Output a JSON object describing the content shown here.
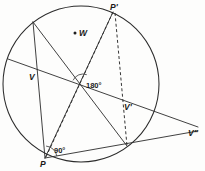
{
  "figure": {
    "background_color": "#fdfdfc",
    "ink_color": "#2b2b2b",
    "width": 205,
    "height": 171
  },
  "circle": {
    "name": "main-circle",
    "center_x": 81,
    "center_y": 84,
    "radius": 78
  },
  "points": [
    {
      "id": "P",
      "label": "P",
      "x": 45,
      "y": 158,
      "label_x": 40,
      "label_y": 167,
      "dot": false
    },
    {
      "id": "Pp",
      "label": "P'",
      "x": 113,
      "y": 12,
      "label_x": 110,
      "label_y": 10,
      "dot": false
    },
    {
      "id": "V",
      "label": "V",
      "x": 32,
      "y": 73,
      "label_x": 29,
      "label_y": 80,
      "dot": false
    },
    {
      "id": "Vp",
      "label": "V'",
      "x": 125,
      "y": 103,
      "label_x": 124,
      "label_y": 110,
      "dot": false
    },
    {
      "id": "Vpp",
      "label": "V\"",
      "x": 188,
      "y": 128,
      "label_x": 188,
      "label_y": 136,
      "dot": false
    },
    {
      "id": "W",
      "label": "W",
      "x": 75,
      "y": 33,
      "label_x": 79,
      "label_y": 36,
      "dot": true
    },
    {
      "id": "T",
      "label": "",
      "x": 33,
      "y": 22,
      "label_x": 0,
      "label_y": 0,
      "dot": false
    },
    {
      "id": "B",
      "label": "",
      "x": 127,
      "y": 146,
      "label_x": 0,
      "label_y": 0,
      "dot": false
    },
    {
      "id": "O",
      "label": "",
      "x": 83,
      "y": 85,
      "label_x": 0,
      "label_y": 0,
      "dot": false
    }
  ],
  "angles": [
    {
      "id": "angle-center",
      "label": "180°",
      "label_x": 86,
      "label_y": 88,
      "vertex_x": 83,
      "vertex_y": 85
    },
    {
      "id": "angle-p",
      "label": "90°",
      "label_x": 54,
      "label_y": 153,
      "vertex_x": 45,
      "vertex_y": 158
    }
  ],
  "solid_lines": [
    {
      "id": "chord-T-P",
      "x1": 33,
      "y1": 22,
      "x2": 45,
      "y2": 158
    },
    {
      "id": "ray-T-B",
      "x1": 33,
      "y1": 22,
      "x2": 127,
      "y2": 146
    },
    {
      "id": "ray-V-Vpp",
      "x1": 8,
      "y1": 59,
      "x2": 198,
      "y2": 127
    },
    {
      "id": "ray-P-Vpp",
      "x1": 45,
      "y1": 158,
      "x2": 198,
      "y2": 131
    },
    {
      "id": "chord-Pp-P",
      "x1": 113,
      "y1": 12,
      "x2": 45,
      "y2": 158
    }
  ],
  "dashed_lines": [
    {
      "id": "dash-Pp-P",
      "x1": 113,
      "y1": 12,
      "x2": 46,
      "y2": 157
    },
    {
      "id": "dash-Pp-B",
      "x1": 115,
      "y1": 13,
      "x2": 127,
      "y2": 146
    }
  ],
  "arc_marks": [
    {
      "id": "arc-center",
      "cx": 83,
      "cy": 85,
      "r": 11,
      "start_deg": 205,
      "end_deg": 290
    },
    {
      "id": "arc-p",
      "cx": 45,
      "cy": 158,
      "r": 12,
      "start_deg": 275,
      "end_deg": 350
    }
  ]
}
